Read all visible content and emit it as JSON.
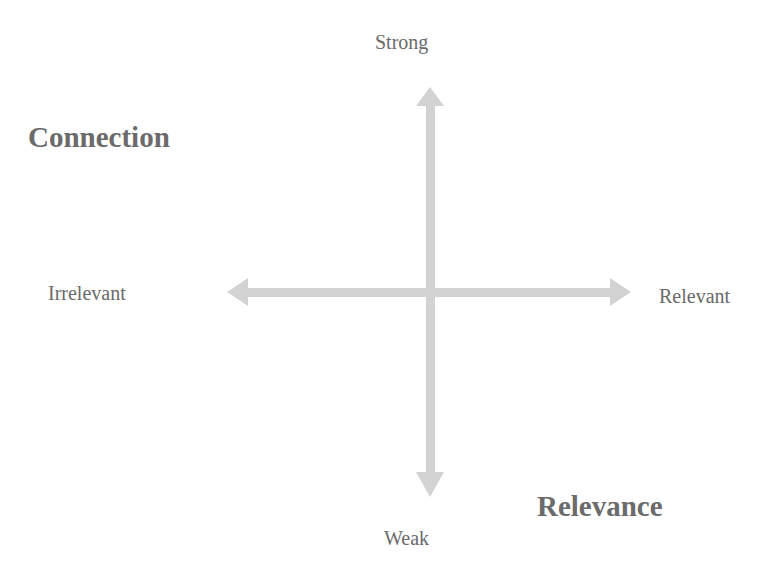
{
  "diagram": {
    "title_y_axis": "Connection",
    "title_x_axis": "Relevance",
    "axis_labels": {
      "top": "Strong",
      "bottom": "Weak",
      "left": "Irrelevant",
      "right": "Relevant"
    },
    "colors": {
      "arrow": "#d2d2d2",
      "text": "#6a6a6a",
      "background": "#ffffff"
    }
  }
}
